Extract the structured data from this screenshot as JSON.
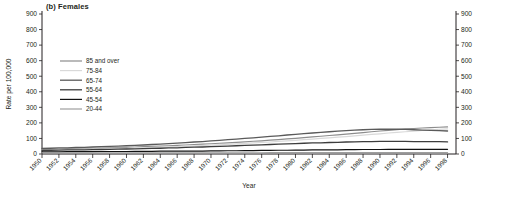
{
  "chart_data": {
    "type": "line",
    "title": "(b) Females",
    "xlabel": "Year",
    "ylabel": "Rate per 100,000",
    "xlim": [
      1950,
      1999
    ],
    "ylim": [
      0,
      900
    ],
    "ytick_step": 100,
    "yticks": [
      0,
      100,
      200,
      300,
      400,
      500,
      600,
      700,
      800,
      900
    ],
    "yticks_right": [
      0,
      100,
      200,
      300,
      400,
      500,
      600,
      700,
      800,
      900
    ],
    "grid": false,
    "legend_position": "upper-left-inside",
    "x": [
      1950,
      1951,
      1952,
      1953,
      1954,
      1955,
      1956,
      1957,
      1958,
      1959,
      1960,
      1961,
      1962,
      1963,
      1964,
      1965,
      1966,
      1967,
      1968,
      1969,
      1970,
      1971,
      1972,
      1973,
      1974,
      1975,
      1976,
      1977,
      1978,
      1979,
      1980,
      1981,
      1982,
      1983,
      1984,
      1985,
      1986,
      1987,
      1988,
      1989,
      1990,
      1991,
      1992,
      1993,
      1994,
      1995,
      1996,
      1997,
      1998
    ],
    "xticks": [
      1950,
      1952,
      1954,
      1956,
      1958,
      1960,
      1962,
      1964,
      1966,
      1968,
      1970,
      1972,
      1974,
      1976,
      1978,
      1980,
      1982,
      1984,
      1986,
      1988,
      1990,
      1992,
      1994,
      1996,
      1998
    ],
    "series": [
      {
        "name": "85 and over",
        "color": "#8c8c8c",
        "width": 1.2,
        "values": [
          30,
          31,
          32,
          33,
          34,
          35,
          37,
          38,
          40,
          41,
          43,
          45,
          47,
          49,
          51,
          53,
          56,
          58,
          61,
          63,
          66,
          69,
          72,
          75,
          78,
          82,
          85,
          89,
          93,
          97,
          101,
          105,
          110,
          114,
          119,
          123,
          128,
          133,
          138,
          143,
          148,
          152,
          157,
          161,
          164,
          167,
          170,
          172,
          174
        ]
      },
      {
        "name": "75-84",
        "color": "#d9d9d9",
        "width": 1.2,
        "values": [
          26,
          27,
          28,
          29,
          30,
          31,
          32,
          33,
          34,
          36,
          37,
          39,
          40,
          42,
          44,
          46,
          48,
          50,
          52,
          54,
          57,
          59,
          62,
          65,
          68,
          71,
          74,
          77,
          81,
          84,
          88,
          92,
          96,
          100,
          104,
          108,
          112,
          117,
          121,
          126,
          130,
          135,
          139,
          143,
          147,
          151,
          155,
          158,
          161
        ]
      },
      {
        "name": "65-74",
        "color": "#5a5a5a",
        "width": 1.3,
        "values": [
          36,
          37,
          39,
          40,
          42,
          43,
          45,
          47,
          49,
          51,
          53,
          56,
          58,
          61,
          64,
          67,
          70,
          73,
          77,
          80,
          84,
          88,
          92,
          96,
          100,
          104,
          108,
          113,
          117,
          122,
          126,
          131,
          135,
          139,
          143,
          147,
          150,
          153,
          156,
          158,
          159,
          160,
          159,
          158,
          156,
          154,
          152,
          150,
          148
        ]
      },
      {
        "name": "55-64",
        "color": "#3d3d3d",
        "width": 1.3,
        "values": [
          24,
          24,
          25,
          26,
          26,
          27,
          28,
          29,
          30,
          31,
          32,
          33,
          34,
          36,
          37,
          39,
          40,
          42,
          44,
          45,
          47,
          49,
          51,
          53,
          55,
          57,
          59,
          61,
          63,
          65,
          67,
          69,
          71,
          72,
          74,
          75,
          77,
          78,
          79,
          80,
          81,
          81,
          81,
          81,
          80,
          80,
          79,
          79,
          78
        ]
      },
      {
        "name": "45-54",
        "color": "#111111",
        "width": 1.2,
        "values": [
          14,
          14,
          14,
          15,
          15,
          15,
          15,
          16,
          16,
          16,
          16,
          17,
          17,
          17,
          18,
          18,
          18,
          19,
          19,
          19,
          20,
          20,
          21,
          21,
          22,
          22,
          23,
          23,
          24,
          24,
          25,
          25,
          26,
          26,
          27,
          27,
          28,
          28,
          29,
          29,
          29,
          30,
          30,
          30,
          30,
          30,
          30,
          30,
          30
        ]
      },
      {
        "name": "20-44",
        "color": "#9e9e9e",
        "width": 1.2,
        "values": [
          8,
          8,
          8,
          8,
          8,
          8,
          8,
          8,
          8,
          8,
          8,
          8,
          8,
          8,
          8,
          8,
          8,
          8,
          8,
          8,
          8,
          8,
          8,
          8,
          8,
          8,
          8,
          9,
          9,
          9,
          9,
          9,
          9,
          9,
          9,
          9,
          9,
          9,
          9,
          9,
          9,
          9,
          9,
          9,
          9,
          9,
          9,
          9,
          9
        ]
      }
    ]
  },
  "legend": {
    "items": [
      {
        "label": "85 and over"
      },
      {
        "label": "75-84"
      },
      {
        "label": "65-74"
      },
      {
        "label": "55-64"
      },
      {
        "label": "45-54"
      },
      {
        "label": "20-44"
      }
    ]
  }
}
